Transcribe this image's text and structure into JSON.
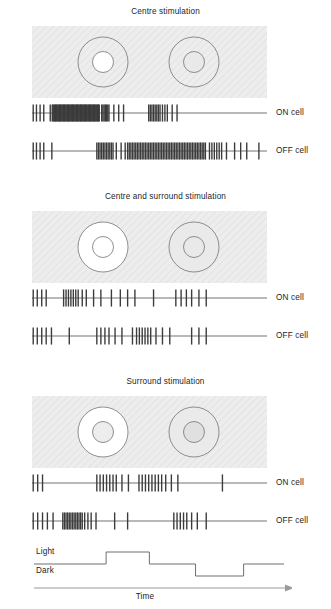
{
  "figure": {
    "caption_type": "receptive-field-response-figure",
    "colors": {
      "field_background": "#ececec",
      "field_hatch": "#e0e0e0",
      "bright_fill": "#ffffff",
      "dark_fill": "#d9d9d9",
      "circle_stroke": "#6b6b6b",
      "spike_color": "#3a3a3a",
      "baseline_color": "#9a9a9a",
      "text_color": "#1d1d1d",
      "axis_color": "#8d8d8d"
    }
  },
  "panels": [
    {
      "id": "centre",
      "title": "Centre stimulation",
      "field": {
        "name": "visual-field-centre-stimulation",
        "background": "#ececec",
        "cells": [
          {
            "name": "on-centre-cell-field",
            "cx": 100,
            "cy": 63,
            "r_outer": 29,
            "r_inner": 12,
            "surround_fill": "#ececec",
            "centre_fill": "#ffffff"
          },
          {
            "name": "off-centre-cell-field",
            "cx": 205,
            "cy": 63,
            "r_outer": 29,
            "r_inner": 12,
            "surround_fill": "#ececec",
            "centre_fill": "#e6e6e6"
          }
        ]
      },
      "traces": [
        {
          "label": "ON cell",
          "name": "on-cell-spike-train",
          "spikes": [
            3,
            11,
            20,
            29,
            45,
            50,
            52,
            54,
            56,
            58,
            60,
            62,
            64,
            66,
            68,
            70,
            72,
            74,
            76,
            78,
            80,
            82,
            84,
            86,
            88,
            90,
            92,
            94,
            96,
            98,
            100,
            102,
            104,
            106,
            108,
            110,
            112,
            114,
            116,
            118,
            120,
            122,
            124,
            126,
            128,
            130,
            132,
            134,
            136,
            138,
            140,
            142,
            144,
            146,
            148,
            150,
            152,
            154,
            156,
            158,
            160,
            162,
            164,
            166,
            172,
            175,
            178,
            181,
            184,
            187,
            190,
            202,
            214,
            226,
            288,
            292,
            296,
            300,
            304,
            308,
            312,
            316,
            322,
            328,
            334,
            346,
            358
          ]
        },
        {
          "label": "OFF cell",
          "name": "off-cell-spike-train",
          "spikes": [
            3,
            11,
            20,
            29,
            49,
            160,
            164,
            168,
            172,
            176,
            180,
            184,
            188,
            192,
            196,
            200,
            208,
            220,
            230,
            236,
            240,
            244,
            248,
            252,
            256,
            260,
            264,
            268,
            272,
            276,
            280,
            284,
            288,
            292,
            296,
            300,
            304,
            308,
            312,
            316,
            320,
            324,
            328,
            332,
            336,
            340,
            344,
            348,
            352,
            356,
            360,
            364,
            368,
            372,
            376,
            380,
            384,
            388,
            392,
            396,
            400,
            404,
            408,
            412,
            416,
            420,
            424,
            428,
            438,
            444,
            450,
            456,
            462,
            468,
            480,
            500,
            515,
            530,
            560
          ]
        }
      ]
    },
    {
      "id": "centre-and-surround",
      "title": "Centre and surround stimulation",
      "field": {
        "name": "visual-field-centre-and-surround-stimulation",
        "background": "#ececec",
        "cells": [
          {
            "name": "on-centre-cell-field",
            "cx": 100,
            "cy": 63,
            "r_outer": 29,
            "r_inner": 12,
            "surround_fill": "#ffffff",
            "centre_fill": "#ffffff"
          },
          {
            "name": "off-centre-cell-field",
            "cx": 205,
            "cy": 63,
            "r_outer": 29,
            "r_inner": 12,
            "surround_fill": "#e8e8e8",
            "centre_fill": "#e6e6e6"
          }
        ]
      },
      "traces": [
        {
          "label": "ON cell",
          "name": "on-cell-spike-train",
          "spikes": [
            3,
            13,
            24,
            35,
            78,
            84,
            90,
            96,
            102,
            108,
            114,
            124,
            134,
            152,
            170,
            196,
            218,
            236,
            254,
            300,
            355,
            368,
            381,
            394,
            412,
            430
          ]
        },
        {
          "label": "OFF cell",
          "name": "off-cell-spike-train",
          "spikes": [
            3,
            13,
            24,
            35,
            48,
            92,
            160,
            170,
            180,
            190,
            205,
            222,
            248,
            258,
            265,
            272,
            279,
            286,
            293,
            306,
            322,
            340,
            394,
            412,
            430
          ]
        }
      ]
    },
    {
      "id": "surround",
      "title": "Surround stimulation",
      "field": {
        "name": "visual-field-surround-stimulation",
        "background": "#ececec",
        "cells": [
          {
            "name": "on-centre-cell-field",
            "cx": 100,
            "cy": 63,
            "r_outer": 29,
            "r_inner": 12,
            "surround_fill": "#ffffff",
            "centre_fill": "#ececec"
          },
          {
            "name": "off-centre-cell-field",
            "cx": 205,
            "cy": 63,
            "r_outer": 29,
            "r_inner": 12,
            "surround_fill": "#e8e8e8",
            "centre_fill": "#dedede"
          }
        ]
      },
      "traces": [
        {
          "label": "ON cell",
          "name": "on-cell-spike-train",
          "spikes": [
            3,
            14,
            26,
            160,
            168,
            176,
            184,
            192,
            200,
            208,
            222,
            238,
            264,
            272,
            280,
            288,
            296,
            304,
            312,
            320,
            330,
            344,
            360,
            470
          ]
        },
        {
          "label": "OFF cell",
          "name": "off-cell-spike-train",
          "spikes": [
            3,
            14,
            26,
            38,
            52,
            76,
            80,
            84,
            88,
            92,
            96,
            100,
            104,
            108,
            112,
            116,
            120,
            124,
            130,
            138,
            146,
            158,
            204,
            236,
            350,
            358,
            366,
            374,
            382,
            394,
            408,
            430
          ]
        }
      ]
    }
  ],
  "stimulus": {
    "name": "light-dark-stimulus-trace",
    "light_label": "Light",
    "dark_label": "Dark",
    "time_label": "Time",
    "levels": [
      {
        "start": 0,
        "end": 75,
        "level": "mid"
      },
      {
        "start": 75,
        "end": 120,
        "level": "light"
      },
      {
        "start": 120,
        "end": 168,
        "level": "mid"
      },
      {
        "start": 168,
        "end": 218,
        "level": "dark"
      },
      {
        "start": 218,
        "end": 260,
        "level": "mid"
      }
    ]
  }
}
